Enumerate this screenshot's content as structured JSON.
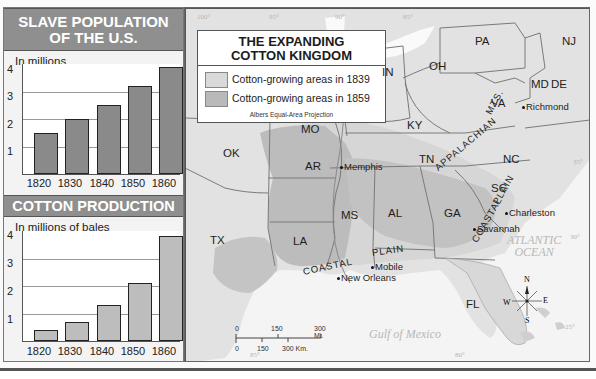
{
  "slave_chart": {
    "title_line1": "SLAVE POPULATION",
    "title_line2": "OF THE U.S.",
    "unit": "In millions"
  },
  "cotton_chart": {
    "title": "COTTON PRODUCTION",
    "unit": "In millions of bales"
  },
  "chart_data": [
    {
      "type": "bar",
      "title": "SLAVE POPULATION OF THE U.S.",
      "xlabel": "",
      "ylabel": "In millions",
      "categories": [
        "1820",
        "1830",
        "1840",
        "1850",
        "1860"
      ],
      "values": [
        1.5,
        2.0,
        2.5,
        3.2,
        3.9
      ],
      "ylim": [
        0,
        4
      ],
      "yticks": [
        "1",
        "2",
        "3",
        "4"
      ],
      "grid": true
    },
    {
      "type": "bar",
      "title": "COTTON PRODUCTION",
      "xlabel": "",
      "ylabel": "In millions of bales",
      "categories": [
        "1820",
        "1830",
        "1840",
        "1850",
        "1860"
      ],
      "values": [
        0.4,
        0.7,
        1.3,
        2.1,
        3.8
      ],
      "ylim": [
        0,
        4
      ],
      "yticks": [
        "1",
        "2",
        "3",
        "4"
      ],
      "grid": true
    }
  ],
  "map": {
    "title_line1": "THE EXPANDING",
    "title_line2": "COTTON KINGDOM",
    "legend": [
      {
        "label": "Cotton-growing areas in 1839",
        "color": "#d9d9d9"
      },
      {
        "label": "Cotton-growing areas in 1859",
        "color": "#b9b9b9"
      }
    ],
    "projection": "Albers Equal-Area Projection",
    "states": [
      "PA",
      "NJ",
      "OH",
      "IN",
      "MD",
      "DE",
      "VA",
      "KY",
      "MO",
      "OK",
      "AR",
      "TN",
      "NC",
      "SC",
      "GA",
      "AL",
      "MS",
      "LA",
      "TX",
      "FL"
    ],
    "cities": [
      "Richmond",
      "Memphis",
      "Charleston",
      "Savannah",
      "Mobile",
      "New Orleans"
    ],
    "regions": {
      "appalachian": "APPALACHIAN",
      "mts": "MTS.",
      "coastal_east": "COASTAL",
      "plain_east": "PLAIN",
      "coastal_gulf": "COASTAL",
      "plain_gulf": "PLAIN"
    },
    "water": {
      "atlantic1": "ATLANTIC",
      "atlantic2": "OCEAN",
      "gulf": "Gulf of Mexico"
    },
    "coords": {
      "lon100": "100°",
      "lon95": "95°",
      "lon90": "90°",
      "lon85": "85°",
      "lat35": "35°",
      "lat30": "30°",
      "lat25": "25°",
      "bottom85": "85°",
      "bottom80": "80°"
    },
    "scale": {
      "mi0": "0",
      "mi150": "150",
      "mi300": "300 Mi.",
      "km0": "0",
      "km150": "150",
      "km300": "300 Km."
    },
    "compass": {
      "n": "N",
      "s": "S",
      "e": "E",
      "w": "W"
    }
  }
}
